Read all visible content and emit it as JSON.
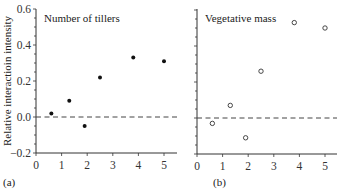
{
  "chart_data": [
    {
      "type": "scatter",
      "panel_label": "(a)",
      "title": "Number of tillers",
      "xlabel": "",
      "ylabel": "Relative interactioin intensity",
      "xlim": [
        0,
        5.4
      ],
      "ylim": [
        -0.2,
        0.6
      ],
      "x_ticks": [
        "0",
        "1",
        "2",
        "3",
        "4",
        "5"
      ],
      "y_ticks": [
        "−0.2",
        "0.0",
        "0.2",
        "0.4",
        "0.6"
      ],
      "marker": "filled-circle",
      "reference_line": {
        "y": 0.0,
        "style": "dashed"
      },
      "grid": false,
      "x": [
        0.6,
        1.3,
        1.9,
        2.5,
        3.8,
        5.0
      ],
      "y": [
        0.02,
        0.09,
        -0.05,
        0.22,
        0.33,
        0.31
      ]
    },
    {
      "type": "scatter",
      "panel_label": "(b)",
      "title": "Vegetative mass",
      "xlabel": "",
      "ylabel": "",
      "xlim": [
        0,
        5.4
      ],
      "ylim": [
        -0.2,
        0.6
      ],
      "x_ticks": [
        "0",
        "1",
        "2",
        "3",
        "4",
        "5"
      ],
      "y_ticks": [],
      "marker": "open-circle",
      "reference_line": {
        "y": 0.0,
        "style": "dashed"
      },
      "grid": false,
      "x": [
        0.6,
        1.3,
        1.9,
        2.5,
        3.8,
        5.0
      ],
      "y": [
        -0.03,
        0.07,
        -0.11,
        0.26,
        0.53,
        0.5
      ]
    }
  ]
}
